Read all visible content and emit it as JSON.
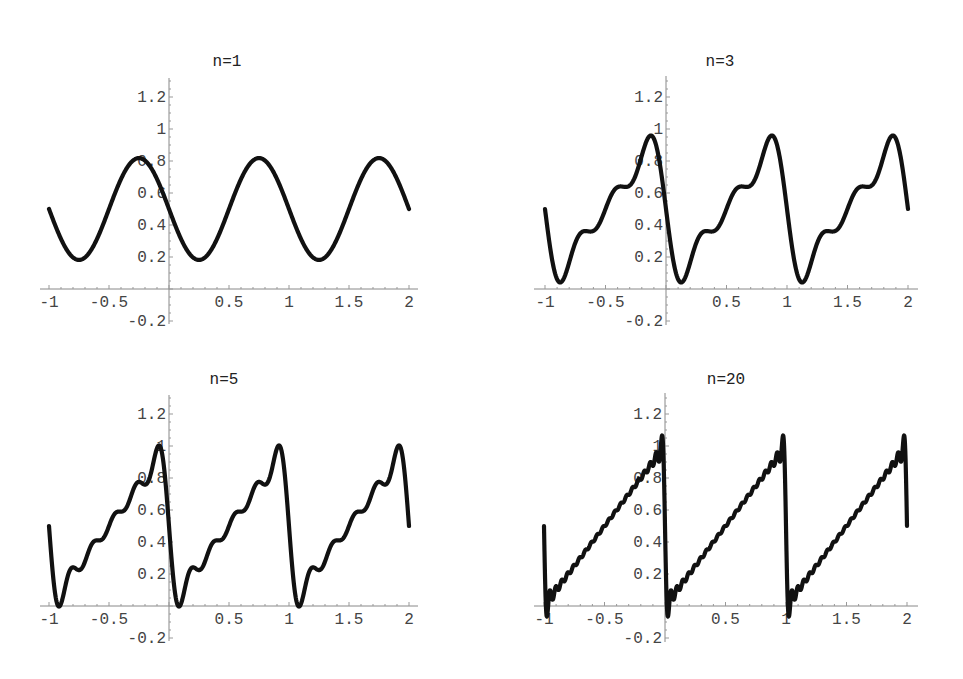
{
  "chart_data": [
    {
      "type": "line",
      "title": "n=1",
      "n": 1,
      "function": "1/2 - (1/pi) * sum_{k=1..n} sin(2*pi*k*x)/k",
      "xlabel": "",
      "ylabel": "",
      "xlim": [
        -1,
        2
      ],
      "ylim": [
        -0.2,
        1.3
      ],
      "xticks": [
        -1,
        -0.5,
        0.5,
        1,
        1.5,
        2
      ],
      "xtick_labels": [
        "-1",
        "-0.5",
        "0.5",
        "1",
        "1.5",
        "2"
      ],
      "yticks": [
        -0.2,
        0.2,
        0.4,
        0.6,
        0.8,
        1,
        1.2
      ],
      "ytick_labels": [
        "-0.2",
        "0.2",
        "0.4",
        "0.6",
        "0.8",
        "1",
        "1.2"
      ],
      "key_points": {
        "x": [
          -1,
          -0.75,
          -0.25,
          0.25,
          0.75,
          1.25,
          1.75,
          2
        ],
        "y": [
          0.5,
          0.18,
          0.82,
          0.18,
          0.82,
          0.18,
          0.82,
          0.5
        ]
      },
      "grid": false,
      "legend": null
    },
    {
      "type": "line",
      "title": "n=3",
      "n": 3,
      "function": "1/2 - (1/pi) * sum_{k=1..n} sin(2*pi*k*x)/k",
      "xlabel": "",
      "ylabel": "",
      "xlim": [
        -1,
        2
      ],
      "ylim": [
        -0.2,
        1.3
      ],
      "xticks": [
        -1,
        -0.5,
        0.5,
        1,
        1.5,
        2
      ],
      "xtick_labels": [
        "-1",
        "-0.5",
        "0.5",
        "1",
        "1.5",
        "2"
      ],
      "yticks": [
        -0.2,
        0.2,
        0.4,
        0.6,
        0.8,
        1,
        1.2
      ],
      "ytick_labels": [
        "-0.2",
        "0.8",
        "0.4",
        "0.6",
        "0.8",
        "1",
        "1.2"
      ],
      "key_points": {
        "x": [
          -1,
          -0.87,
          -0.13,
          0.13,
          0.87,
          1.13,
          1.87,
          2
        ],
        "y": [
          0.5,
          0.03,
          0.97,
          0.03,
          0.97,
          0.03,
          0.97,
          0.5
        ]
      },
      "grid": false,
      "legend": null
    },
    {
      "type": "line",
      "title": "n=5",
      "n": 5,
      "function": "1/2 - (1/pi) * sum_{k=1..n} sin(2*pi*k*x)/k",
      "xlabel": "",
      "ylabel": "",
      "xlim": [
        -1,
        2
      ],
      "ylim": [
        -0.2,
        1.3
      ],
      "xticks": [
        -1,
        -0.5,
        0.5,
        1,
        1.5,
        2
      ],
      "xtick_labels": [
        "-1",
        "-0.5",
        "0.5",
        "1",
        "1.5",
        "2"
      ],
      "yticks": [
        -0.2,
        0.2,
        0.4,
        0.6,
        0.8,
        1,
        1.2
      ],
      "ytick_labels": [
        "-0.2",
        "0.2",
        "0.4",
        "0.6",
        "0.8",
        "1",
        "1.2"
      ],
      "key_points": {
        "x": [
          -1,
          -0.91,
          -0.09,
          0.09,
          0.91,
          1.09,
          1.91,
          2
        ],
        "y": [
          0.5,
          0.0,
          1.0,
          0.0,
          1.0,
          0.0,
          1.0,
          0.5
        ]
      },
      "grid": false,
      "legend": null
    },
    {
      "type": "line",
      "title": "n=20",
      "n": 20,
      "function": "1/2 - (1/pi) * sum_{k=1..n} sin(2*pi*k*x)/k",
      "xlabel": "",
      "ylabel": "",
      "xlim": [
        -1,
        2
      ],
      "ylim": [
        -0.2,
        1.3
      ],
      "xticks": [
        -1,
        -0.5,
        0.5,
        1,
        1.5,
        2
      ],
      "xtick_labels": [
        "-1",
        "-0.5",
        "0.5",
        "1",
        "1.5",
        "2"
      ],
      "yticks": [
        -0.2,
        0.2,
        0.4,
        0.6,
        0.8,
        1,
        1.2
      ],
      "ytick_labels": [
        "-0.2",
        "0.2",
        "0.4",
        "0.6",
        "0.8",
        "1",
        "1.2"
      ],
      "key_points": {
        "x": [
          -1,
          -0.98,
          -0.02,
          0.02,
          0.98,
          1.02,
          1.98,
          2
        ],
        "y": [
          0.5,
          -0.09,
          1.09,
          -0.09,
          1.09,
          -0.09,
          1.09,
          0.5
        ]
      },
      "grid": false,
      "legend": null
    }
  ],
  "layout": {
    "panels": [
      {
        "x0": 169,
        "y0": 289,
        "sx": 120,
        "sy": 160,
        "axis_left": 40,
        "axis_right": 418,
        "axis_top": 78,
        "axis_bottom": 324,
        "title_x": 227,
        "title_y": 66
      },
      {
        "x0": 666,
        "y0": 289,
        "sx": 121,
        "sy": 160,
        "axis_left": 534,
        "axis_right": 918,
        "axis_top": 76,
        "axis_bottom": 325,
        "title_x": 720,
        "title_y": 66
      },
      {
        "x0": 169,
        "y0": 606,
        "sx": 120,
        "sy": 160,
        "axis_left": 40,
        "axis_right": 418,
        "axis_top": 395,
        "axis_bottom": 641,
        "title_x": 224,
        "title_y": 384
      },
      {
        "x0": 665,
        "y0": 606,
        "sx": 121,
        "sy": 160,
        "axis_left": 534,
        "axis_right": 918,
        "axis_top": 393,
        "axis_bottom": 642,
        "title_x": 726,
        "title_y": 384
      }
    ],
    "line_color": "#111111",
    "axis_color": "#888888"
  }
}
